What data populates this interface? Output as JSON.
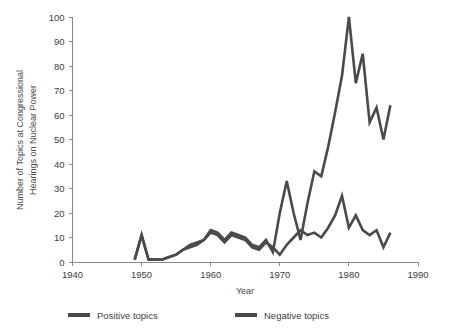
{
  "chart_data": {
    "type": "line",
    "title": "",
    "subtitle": "",
    "xlabel": "Year",
    "ylabel": "Number of Topics at Congressional Hearings on Nuclear Power",
    "ylabel_lines": [
      "Number of Topics at Congressional",
      "Hearings on Nuclear Power"
    ],
    "xlim": [
      1940,
      1990
    ],
    "ylim": [
      0,
      100
    ],
    "xticks": [
      1940,
      1950,
      1960,
      1970,
      1980,
      1990
    ],
    "xtick_labels": [
      "1940",
      "1950",
      "1960",
      "1970",
      "1980",
      "1990"
    ],
    "yticks": [
      0,
      10,
      20,
      30,
      40,
      50,
      60,
      70,
      80,
      90,
      100
    ],
    "ytick_labels": [
      "0",
      "10",
      "20",
      "30",
      "40",
      "50",
      "60",
      "70",
      "80",
      "90",
      "100"
    ],
    "grid": false,
    "legend_position": "bottom",
    "series": [
      {
        "name": "Positive topics",
        "color": "#4a4a4a",
        "x": [
          1949,
          1950,
          1951,
          1952,
          1953,
          1954,
          1955,
          1956,
          1957,
          1958,
          1959,
          1960,
          1961,
          1962,
          1963,
          1964,
          1965,
          1966,
          1967,
          1968,
          1969,
          1970,
          1971,
          1972,
          1973,
          1974,
          1975,
          1976,
          1977,
          1978,
          1979,
          1980,
          1981,
          1982,
          1983,
          1984,
          1985,
          1986
        ],
        "values": [
          1,
          11,
          1,
          1,
          1,
          2,
          3,
          5,
          6,
          7,
          9,
          12,
          11,
          8,
          11,
          10,
          9,
          6,
          5,
          8,
          6,
          3,
          7,
          10,
          13,
          11,
          12,
          10,
          14,
          19,
          27,
          14,
          19,
          13,
          11,
          13,
          6,
          12
        ]
      },
      {
        "name": "Negative topics",
        "color": "#4a4a4a",
        "x": [
          1949,
          1950,
          1951,
          1952,
          1953,
          1954,
          1955,
          1956,
          1957,
          1958,
          1959,
          1960,
          1961,
          1962,
          1963,
          1964,
          1965,
          1966,
          1967,
          1968,
          1969,
          1970,
          1971,
          1972,
          1973,
          1974,
          1975,
          1976,
          1977,
          1978,
          1979,
          1980,
          1981,
          1982,
          1983,
          1984,
          1985,
          1986
        ],
        "values": [
          1,
          11,
          1,
          1,
          1,
          2,
          3,
          5,
          7,
          8,
          9,
          13,
          12,
          9,
          12,
          11,
          10,
          7,
          6,
          9,
          4,
          20,
          33,
          20,
          9,
          24,
          37,
          35,
          47,
          61,
          76,
          100,
          73,
          85,
          57,
          63,
          50,
          64
        ]
      }
    ],
    "legend": [
      {
        "label": "Positive topics",
        "color": "#4a4a4a"
      },
      {
        "label": "Negative topics",
        "color": "#4a4a4a"
      }
    ]
  }
}
